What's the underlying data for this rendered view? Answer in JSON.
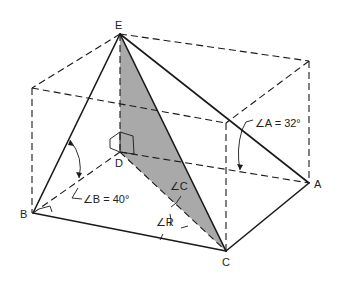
{
  "diagram": {
    "shade_color": "#a9a9a9",
    "line_color": "#1a1a1a",
    "points": {
      "E": {
        "label": "E",
        "x": 120,
        "y": 34
      },
      "D": {
        "label": "D",
        "x": 120,
        "y": 152
      },
      "B": {
        "label": "B",
        "x": 33,
        "y": 213
      },
      "C": {
        "label": "C",
        "x": 226,
        "y": 251
      },
      "A": {
        "label": "A",
        "x": 309,
        "y": 183
      }
    },
    "annotations": {
      "angle_a": "∠A = 32°",
      "angle_b": "∠B = 40°",
      "angle_c": "∠C",
      "angle_r": "∠R"
    }
  }
}
